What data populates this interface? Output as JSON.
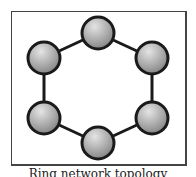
{
  "diagram": {
    "type": "ring-topology",
    "caption": "Ring network topology",
    "colors": {
      "edge": "#1a1a1a",
      "node_fill_light": "#e0e0e0",
      "node_fill_dark": "#8a8a8a",
      "frame": "#444444"
    },
    "nodes": [
      {
        "id": "n1",
        "label": "",
        "cx": 98,
        "cy": 33
      },
      {
        "id": "n2",
        "label": "",
        "cx": 152,
        "cy": 58
      },
      {
        "id": "n3",
        "label": "",
        "cx": 152,
        "cy": 118
      },
      {
        "id": "n4",
        "label": "",
        "cx": 98,
        "cy": 143
      },
      {
        "id": "n5",
        "label": "",
        "cx": 44,
        "cy": 118
      },
      {
        "id": "n6",
        "label": "",
        "cx": 44,
        "cy": 58
      }
    ],
    "edges": [
      [
        "n1",
        "n2"
      ],
      [
        "n2",
        "n3"
      ],
      [
        "n3",
        "n4"
      ],
      [
        "n4",
        "n5"
      ],
      [
        "n5",
        "n6"
      ],
      [
        "n6",
        "n1"
      ]
    ]
  }
}
